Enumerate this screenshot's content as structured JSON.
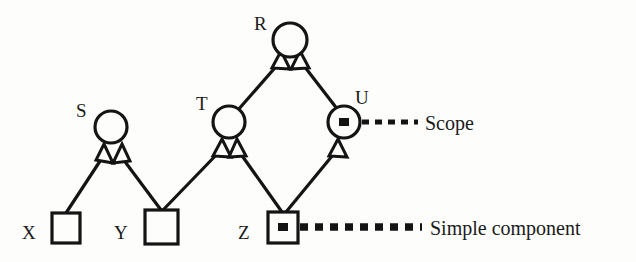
{
  "diagram": {
    "background_color": "#fdfdfc",
    "stroke_color": "#141414",
    "nodes": [
      {
        "id": "R",
        "label": "R",
        "shape": "circle",
        "cx": 290,
        "cy": 40,
        "r": 17,
        "marked": false,
        "label_x": 254,
        "label_y": 30
      },
      {
        "id": "S",
        "label": "S",
        "shape": "circle",
        "cx": 111,
        "cy": 127,
        "r": 16,
        "marked": false,
        "label_x": 76,
        "label_y": 117
      },
      {
        "id": "T",
        "label": "T",
        "shape": "circle",
        "cx": 229,
        "cy": 122,
        "r": 16,
        "marked": false,
        "label_x": 196,
        "label_y": 110
      },
      {
        "id": "U",
        "label": "U",
        "shape": "circle",
        "cx": 344,
        "cy": 122,
        "r": 16,
        "marked": true,
        "label_x": 355,
        "label_y": 104
      },
      {
        "id": "X",
        "label": "X",
        "shape": "square",
        "x": 52,
        "y": 213,
        "w": 28,
        "h": 30,
        "marked": false,
        "label_x": 24,
        "label_y": 237
      },
      {
        "id": "Y",
        "label": "Y",
        "shape": "square",
        "x": 145,
        "y": 210,
        "w": 33,
        "h": 34,
        "marked": false,
        "label_x": 116,
        "label_y": 237
      },
      {
        "id": "Z",
        "label": "Z",
        "shape": "square",
        "x": 268,
        "y": 212,
        "w": 30,
        "h": 31,
        "marked": true,
        "label_x": 240,
        "label_y": 237
      }
    ],
    "edges": [
      {
        "from": "X",
        "to": "S",
        "arrow": "hollow-triangle"
      },
      {
        "from": "Y",
        "to": "S",
        "arrow": "hollow-triangle"
      },
      {
        "from": "Y",
        "to": "T",
        "arrow": "hollow-triangle"
      },
      {
        "from": "Z",
        "to": "T",
        "arrow": "hollow-triangle"
      },
      {
        "from": "Z",
        "to": "U",
        "arrow": "hollow-triangle"
      },
      {
        "from": "T",
        "to": "R",
        "arrow": "hollow-triangle"
      },
      {
        "from": "U",
        "to": "R",
        "arrow": "hollow-triangle"
      }
    ],
    "annotations": [
      {
        "id": "scope",
        "text": "Scope",
        "target": "U",
        "line_style": "dashed-thin",
        "line_x1": 362,
        "line_y1": 122,
        "line_x2": 418,
        "line_y2": 122,
        "text_x": 425,
        "text_y": 130
      },
      {
        "id": "simple-component",
        "text": "Simple component",
        "target": "Z",
        "line_style": "dashed-thick",
        "line_x1": 300,
        "line_y1": 227,
        "line_x2": 422,
        "line_y2": 227,
        "text_x": 430,
        "text_y": 235
      }
    ]
  }
}
